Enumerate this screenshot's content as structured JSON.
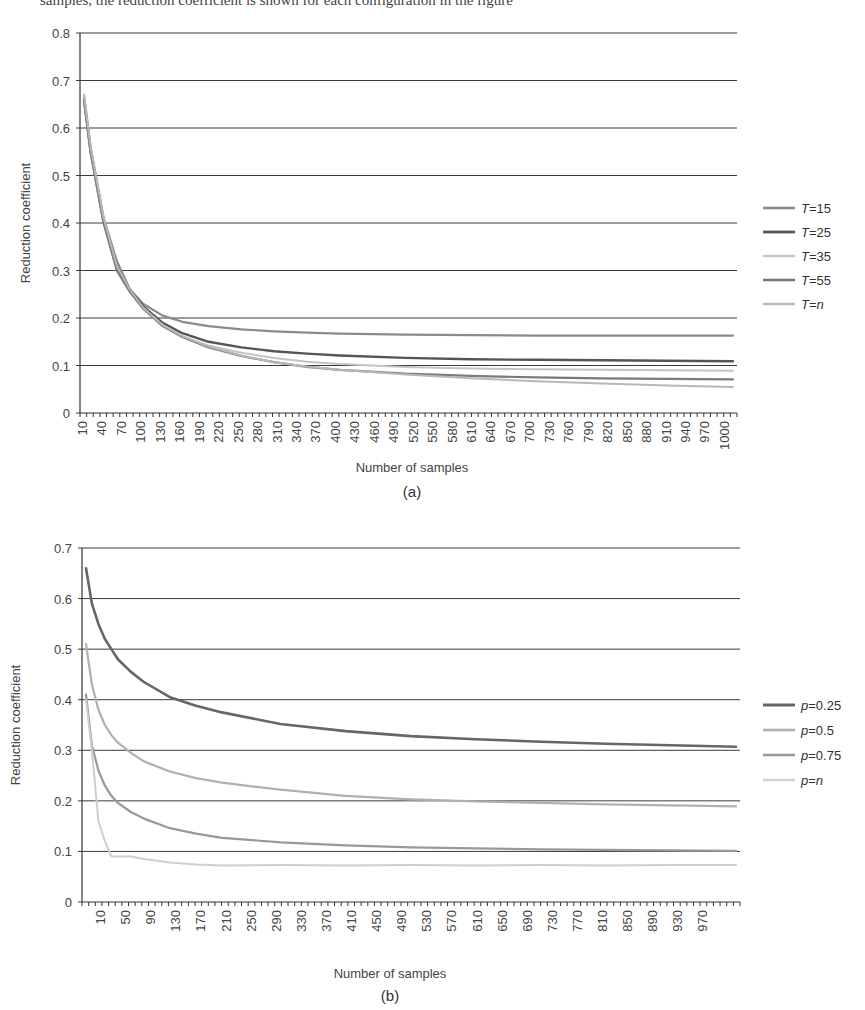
{
  "header_fragment": "samples, the reduction coefficient is shown for each configuration in the figure",
  "chart_data": [
    {
      "type": "line",
      "panel": "(a)",
      "title": "",
      "xlabel": "Number of samples",
      "ylabel": "Reduction coefficient",
      "ylim": [
        0,
        0.8
      ],
      "yticks": [
        "0",
        "0.1",
        "0.2",
        "0.3",
        "0.4",
        "0.5",
        "0.6",
        "0.7",
        "0.8"
      ],
      "xlim": [
        10,
        1000
      ],
      "xticks": [
        "10",
        "40",
        "70",
        "100",
        "130",
        "160",
        "190",
        "220",
        "250",
        "280",
        "310",
        "340",
        "370",
        "400",
        "430",
        "460",
        "490",
        "520",
        "550",
        "580",
        "610",
        "640",
        "670",
        "700",
        "730",
        "760",
        "790",
        "820",
        "850",
        "880",
        "910",
        "940",
        "970",
        "1000"
      ],
      "grid": true,
      "legend_position": "right",
      "x": [
        10,
        20,
        40,
        60,
        80,
        100,
        130,
        160,
        200,
        250,
        300,
        350,
        400,
        500,
        600,
        700,
        800,
        900,
        1000
      ],
      "series": [
        {
          "name": "T=15",
          "color": "#8a8a8a",
          "width": 2.2,
          "values": [
            0.67,
            0.56,
            0.41,
            0.32,
            0.26,
            0.23,
            0.205,
            0.192,
            0.183,
            0.176,
            0.172,
            0.169,
            0.167,
            0.165,
            0.164,
            0.163,
            0.163,
            0.163,
            0.163
          ]
        },
        {
          "name": "T=25",
          "color": "#555555",
          "width": 2.4,
          "values": [
            0.66,
            0.55,
            0.4,
            0.31,
            0.26,
            0.225,
            0.19,
            0.168,
            0.15,
            0.138,
            0.13,
            0.125,
            0.121,
            0.116,
            0.113,
            0.112,
            0.111,
            0.11,
            0.109
          ]
        },
        {
          "name": "T=35",
          "color": "#c4c4c4",
          "width": 2.0,
          "values": [
            0.67,
            0.55,
            0.4,
            0.3,
            0.255,
            0.22,
            0.185,
            0.162,
            0.142,
            0.127,
            0.116,
            0.108,
            0.103,
            0.097,
            0.094,
            0.092,
            0.091,
            0.09,
            0.089
          ]
        },
        {
          "name": "T=55",
          "color": "#7a7a7a",
          "width": 2.2,
          "values": [
            0.66,
            0.55,
            0.4,
            0.3,
            0.255,
            0.22,
            0.183,
            0.16,
            0.138,
            0.12,
            0.107,
            0.097,
            0.091,
            0.083,
            0.078,
            0.075,
            0.073,
            0.072,
            0.071
          ]
        },
        {
          "name": "T=n",
          "color": "#b8b8b8",
          "width": 2.0,
          "values": [
            0.67,
            0.56,
            0.41,
            0.31,
            0.26,
            0.222,
            0.185,
            0.162,
            0.14,
            0.121,
            0.107,
            0.098,
            0.091,
            0.081,
            0.073,
            0.067,
            0.062,
            0.058,
            0.055
          ]
        }
      ]
    },
    {
      "type": "line",
      "panel": "(b)",
      "title": "",
      "xlabel": "Number of samples",
      "ylabel": "Reduction coefficient",
      "ylim": [
        0,
        0.7
      ],
      "yticks": [
        "0",
        "0.1",
        "0.2",
        "0.3",
        "0.4",
        "0.5",
        "0.6",
        "0.7"
      ],
      "xlim": [
        1,
        1000
      ],
      "xticks": [
        "10",
        "50",
        "90",
        "130",
        "170",
        "210",
        "250",
        "290",
        "330",
        "370",
        "410",
        "450",
        "490",
        "530",
        "570",
        "610",
        "650",
        "690",
        "730",
        "770",
        "810",
        "850",
        "890",
        "930",
        "970"
      ],
      "grid": true,
      "legend_position": "right",
      "x": [
        1,
        10,
        20,
        30,
        40,
        50,
        70,
        90,
        130,
        170,
        210,
        300,
        400,
        500,
        600,
        700,
        800,
        900,
        1000
      ],
      "series": [
        {
          "name": "p=0.25",
          "color": "#666666",
          "width": 2.6,
          "values": [
            0.66,
            0.59,
            0.55,
            0.52,
            0.5,
            0.48,
            0.455,
            0.435,
            0.405,
            0.388,
            0.375,
            0.352,
            0.338,
            0.328,
            0.322,
            0.317,
            0.313,
            0.31,
            0.307
          ]
        },
        {
          "name": "p=0.5",
          "color": "#b0b0b0",
          "width": 2.2,
          "values": [
            0.51,
            0.43,
            0.38,
            0.35,
            0.33,
            0.315,
            0.295,
            0.278,
            0.258,
            0.245,
            0.236,
            0.222,
            0.21,
            0.203,
            0.199,
            0.196,
            0.193,
            0.191,
            0.189
          ]
        },
        {
          "name": "p=0.75",
          "color": "#999999",
          "width": 2.2,
          "values": [
            0.41,
            0.31,
            0.26,
            0.23,
            0.21,
            0.196,
            0.178,
            0.165,
            0.146,
            0.135,
            0.127,
            0.118,
            0.112,
            0.108,
            0.106,
            0.104,
            0.103,
            0.102,
            0.101
          ]
        },
        {
          "name": "p=n",
          "color": "#cfcfcf",
          "width": 2.0,
          "values": [
            0.4,
            0.3,
            0.16,
            0.12,
            0.09,
            0.09,
            0.09,
            0.085,
            0.078,
            0.074,
            0.072,
            0.073,
            0.072,
            0.073,
            0.072,
            0.073,
            0.072,
            0.073,
            0.073
          ]
        }
      ]
    }
  ]
}
